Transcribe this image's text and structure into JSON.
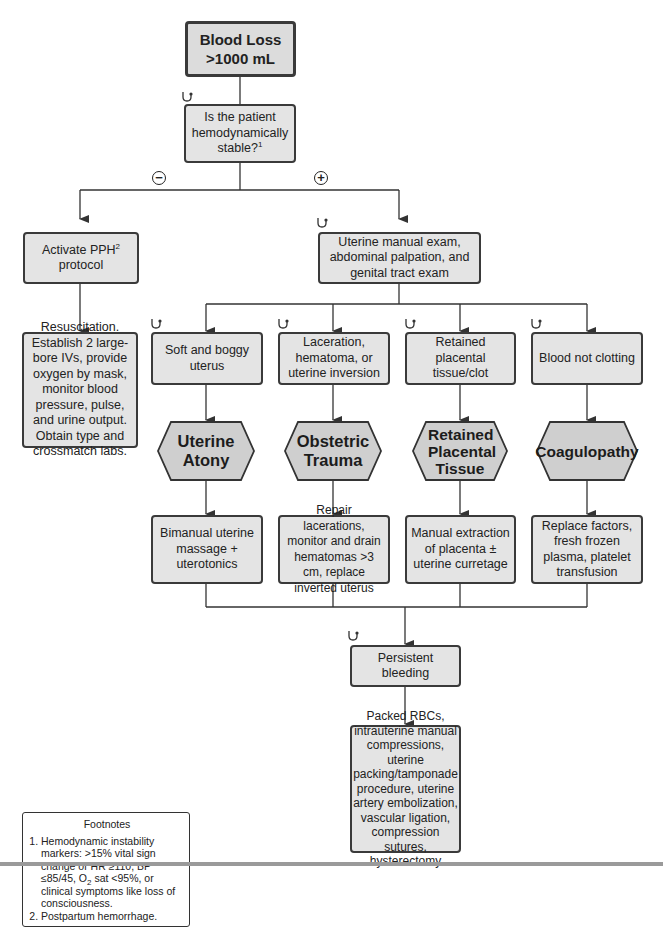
{
  "nodes": {
    "start": {
      "line1": "Blood Loss",
      "line2": ">1000 mL"
    },
    "question": {
      "text": "Is the patient hemodynamically stable?",
      "footnote_ref": "1"
    },
    "negative_label": "−",
    "positive_label": "+",
    "activate": {
      "text": "Activate PPH",
      "footnote_ref": "2",
      "text2": "protocol"
    },
    "exam": {
      "text": "Uterine manual exam, abdominal palpation, and genital tract exam"
    },
    "resuscitation": {
      "text": "Resuscitation. Establish 2 large-bore IVs, provide oxygen by mask, monitor blood pressure, pulse, and urine output. Obtain type and crossmatch labs."
    },
    "findings": [
      {
        "text": "Soft and boggy uterus"
      },
      {
        "text": "Laceration, hematoma, or uterine inversion"
      },
      {
        "text": "Retained placental tissue/clot"
      },
      {
        "text": "Blood not clotting"
      }
    ],
    "diagnoses": [
      {
        "text": "Uterine Atony"
      },
      {
        "text": "Obstetric Trauma"
      },
      {
        "text": "Retained Placental Tissue"
      },
      {
        "text": "Coagulopathy"
      }
    ],
    "treatments": [
      {
        "text": "Bimanual uterine massage + uterotonics"
      },
      {
        "text": "Repair lacerations, monitor and drain hematomas >3 cm, replace inverted uterus"
      },
      {
        "text": "Manual extraction of placenta ± uterine curretage"
      },
      {
        "text": "Replace factors, fresh frozen plasma, platelet transfusion"
      }
    ],
    "persistent": {
      "text": "Persistent bleeding"
    },
    "final": {
      "text": "Packed RBCs, intrauterine manual compressions, uterine packing/tamponade procedure, uterine artery embolization, vascular ligation, compression sutures, hysterectomy"
    }
  },
  "footnotes": {
    "title": "Footnotes",
    "items": [
      {
        "pre": "Hemodynamic instability markers: >15% vital sign change or HR ≥110, BP ≤85/45, O",
        "sub": "2",
        "post": " sat <95%, or clinical symptoms like loss of consciousness."
      },
      {
        "pre": "Postpartum hemorrhage.",
        "sub": "",
        "post": ""
      }
    ]
  },
  "icons": {
    "stethoscope": "stethoscope-icon"
  },
  "colors": {
    "box_fill": "#e4e4e4",
    "hex_fill": "#cfcfcf",
    "stroke": "#3a3a3a"
  }
}
